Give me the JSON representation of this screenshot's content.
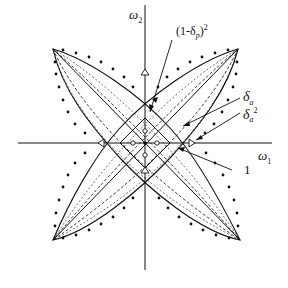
{
  "diagram": {
    "type": "2D frequency response contour (fan/diamond filter)",
    "axes": {
      "x_label": "ω",
      "x_label_sub": "1",
      "y_label": "ω",
      "y_label_sub": "2"
    },
    "annotations": [
      {
        "id": "passband-edge",
        "text_pre": "(1-δ",
        "sub": "p",
        "text_post": ")",
        "sup": "2"
      },
      {
        "id": "delta-a",
        "text": "δ",
        "sub": "a"
      },
      {
        "id": "delta-a-squared",
        "text": "δ",
        "sub": "a",
        "sup": "2"
      },
      {
        "id": "unity",
        "text": "1"
      }
    ],
    "legend_styles": {
      "solid": "contour level 1 / transition",
      "dashed": "intermediate contours",
      "dotted": "outer contour",
      "triangle_markers": "δ_a² points on axes",
      "circle_markers": "inner points near origin"
    },
    "colors": {
      "ink": "#111111",
      "background": "#ffffff"
    }
  }
}
